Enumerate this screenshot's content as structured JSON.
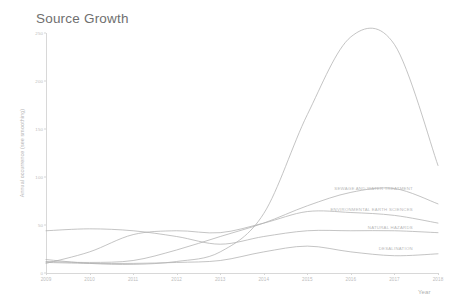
{
  "chart": {
    "title": "Source Growth",
    "xlabel": "Year",
    "ylabel": "Annual occurrence (see smoothing)"
  },
  "chart_data": {
    "type": "line",
    "title": "Source Growth",
    "xlabel": "Year",
    "ylabel": "Annual occurrence (see smoothing)",
    "x": [
      2009,
      2010,
      2011,
      2012,
      2013,
      2014,
      2015,
      2016,
      2017,
      2018
    ],
    "xlim": [
      2009,
      2018
    ],
    "ylim": [
      0,
      250
    ],
    "yticks": [
      0,
      50,
      100,
      150,
      200,
      250
    ],
    "ytick_labels": [
      "0",
      "50",
      "100",
      "150",
      "200",
      "250"
    ],
    "xticks": [
      2009,
      2010,
      2011,
      2012,
      2013,
      2014,
      2015,
      2016,
      2017,
      2018
    ],
    "xtick_labels": [
      "2009",
      "2010",
      "2011",
      "2012",
      "2013",
      "2014",
      "2015",
      "2016",
      "2017",
      "2018"
    ],
    "grid": false,
    "legend_position": "inline-right-end-labels",
    "line_color": "#b0b0b0",
    "series": [
      {
        "name": "",
        "label_shown": false,
        "values": [
          14,
          10,
          9,
          12,
          22,
          62,
          165,
          246,
          238,
          112
        ]
      },
      {
        "name": "SEWAGE AND WATER TREATMENT",
        "label_shown": true,
        "values": [
          12,
          11,
          13,
          24,
          38,
          52,
          70,
          84,
          88,
          72
        ]
      },
      {
        "name": "ENVIRONMENTAL EARTH SCIENCES",
        "label_shown": true,
        "values": [
          10,
          22,
          40,
          44,
          42,
          52,
          64,
          63,
          60,
          52
        ]
      },
      {
        "name": "NATURAL HAZARDS",
        "label_shown": true,
        "values": [
          44,
          46,
          44,
          38,
          30,
          38,
          44,
          44,
          44,
          42
        ]
      },
      {
        "name": "DESALINATION",
        "label_shown": true,
        "values": [
          11,
          10,
          10,
          11,
          13,
          22,
          28,
          22,
          18,
          20
        ]
      }
    ]
  }
}
